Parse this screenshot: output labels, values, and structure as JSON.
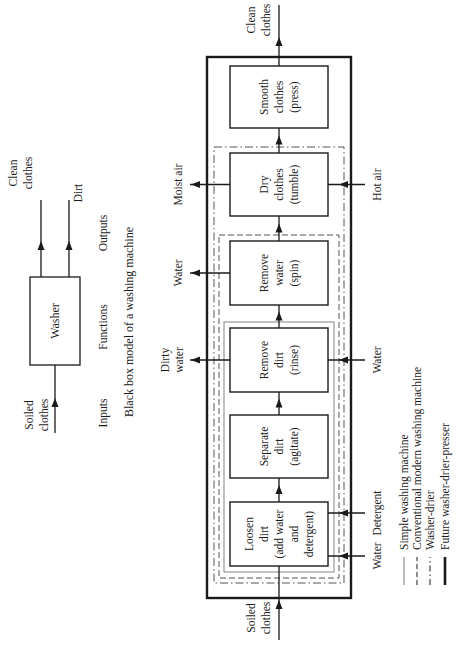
{
  "black_box": {
    "title": "Washer",
    "caption": "Black box model of a washing machine",
    "column_labels": {
      "inputs": "Inputs",
      "functions": "Functions",
      "outputs": "Outputs"
    },
    "input": [
      "Soiled",
      "clothes"
    ],
    "outputs": [
      {
        "lines": [
          "Clean",
          "clothes"
        ]
      },
      {
        "lines": [
          "Dirt"
        ]
      }
    ]
  },
  "process": {
    "input_label": [
      "Soiled",
      "clothes"
    ],
    "output_label": [
      "Clean",
      "clothes"
    ],
    "steps": [
      {
        "id": "loosen",
        "lines": [
          "Loosen",
          "dirt",
          "(add water",
          "and",
          "detergent)"
        ]
      },
      {
        "id": "separate",
        "lines": [
          "Separate",
          "dirt",
          "(agitate)"
        ]
      },
      {
        "id": "rinse",
        "lines": [
          "Remove",
          "dirt",
          "(rinse)"
        ]
      },
      {
        "id": "spin",
        "lines": [
          "Remove",
          "water",
          "(spin)"
        ]
      },
      {
        "id": "dry",
        "lines": [
          "Dry",
          "clothes",
          "(tumble)"
        ]
      },
      {
        "id": "press",
        "lines": [
          "Smooth",
          "clothes",
          "(press)"
        ]
      }
    ],
    "side_inputs": [
      {
        "step": "loosen",
        "lines": [
          "Water"
        ],
        "offset": "low"
      },
      {
        "step": "loosen",
        "lines": [
          "Detergent"
        ],
        "offset": "high"
      },
      {
        "step": "rinse",
        "lines": [
          "Water"
        ]
      },
      {
        "step": "dry",
        "lines": [
          "Hot air"
        ]
      }
    ],
    "side_outputs": [
      {
        "step": "rinse",
        "lines": [
          "Dirty",
          "water"
        ]
      },
      {
        "step": "spin",
        "lines": [
          "Water"
        ]
      },
      {
        "step": "dry",
        "lines": [
          "Moist air"
        ]
      }
    ]
  },
  "legend": [
    {
      "style": "thin-solid",
      "label": "Simple washing machine"
    },
    {
      "style": "dashed",
      "label": "Conventional modern washing machine"
    },
    {
      "style": "dash-dot",
      "label": "Washer-drier"
    },
    {
      "style": "thick-solid",
      "label": "Future washer-drier-presser"
    }
  ]
}
